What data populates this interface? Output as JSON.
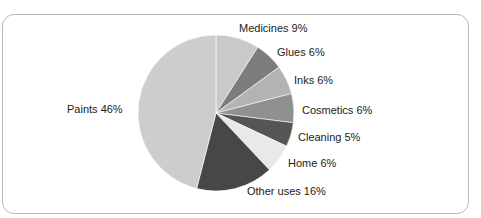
{
  "chart_data": {
    "type": "pie",
    "title": "",
    "start_angle": "12 o'clock, clockwise",
    "slices": [
      {
        "label": "Medicines",
        "value": 9,
        "color": "#c9c9c9",
        "text": "Medicines 9%"
      },
      {
        "label": "Glues",
        "value": 6,
        "color": "#7c7c7c",
        "text": "Glues 6%"
      },
      {
        "label": "Inks",
        "value": 6,
        "color": "#b3b3b3",
        "text": "Inks 6%"
      },
      {
        "label": "Cosmetics",
        "value": 6,
        "color": "#909090",
        "text": "Cosmetics 6%"
      },
      {
        "label": "Cleaning",
        "value": 5,
        "color": "#555555",
        "text": "Cleaning 5%"
      },
      {
        "label": "Home",
        "value": 6,
        "color": "#e9e9e9",
        "text": "Home 6%"
      },
      {
        "label": "Other uses",
        "value": 16,
        "color": "#474747",
        "text": "Other uses 16%"
      },
      {
        "label": "Paints",
        "value": 46,
        "color": "#cdcdcd",
        "text": "Paints 46%"
      }
    ]
  },
  "labels": {
    "medicines": "Medicines 9%",
    "glues": "Glues 6%",
    "inks": "Inks 6%",
    "cosmetics": "Cosmetics 6%",
    "cleaning": "Cleaning 5%",
    "home": "Home 6%",
    "other": "Other uses 16%",
    "paints": "Paints 46%"
  }
}
